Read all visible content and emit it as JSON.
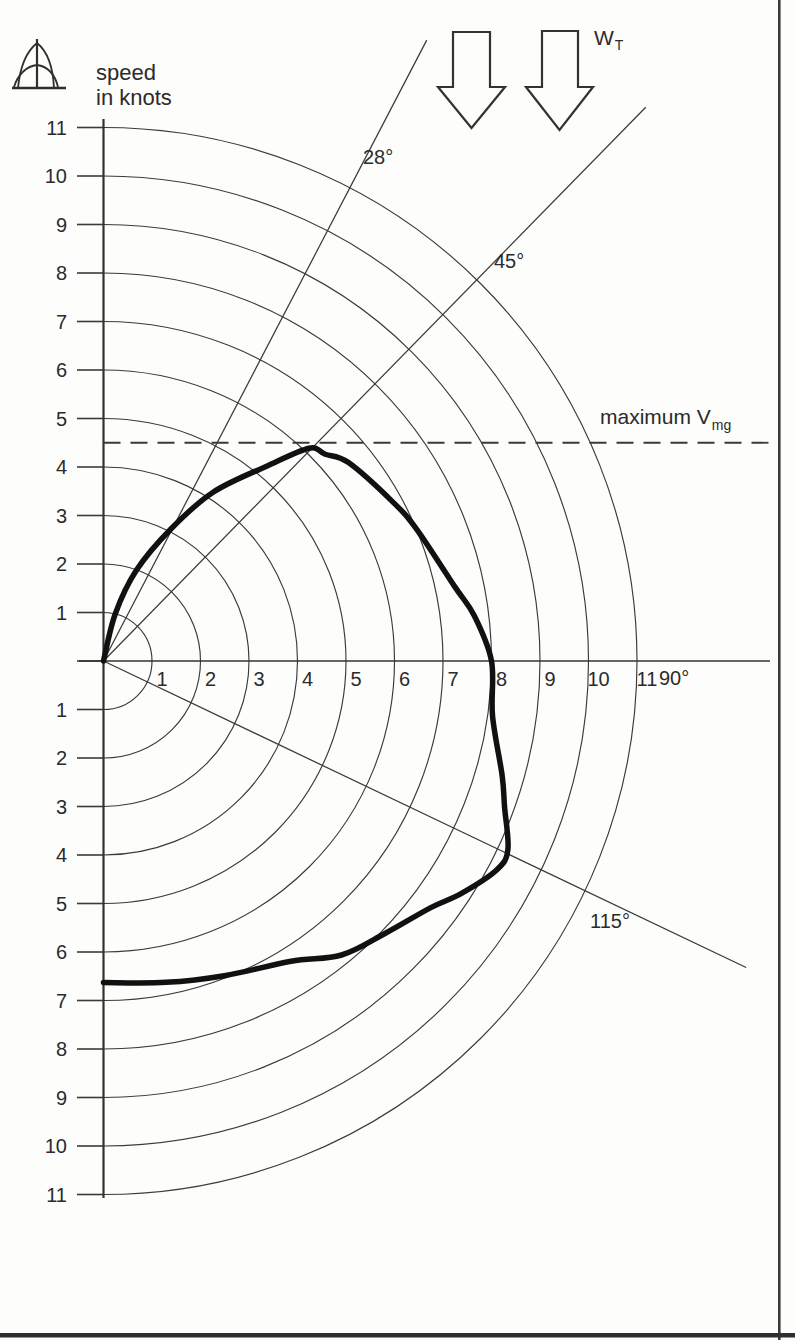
{
  "page": {
    "background": "#fdfdfb",
    "scan_edge_color": "#343434",
    "ink_color": "#3a3a3a",
    "curve_color": "#111111"
  },
  "header": {
    "axis_title_line1": "speed",
    "axis_title_line2": "in knots",
    "true_wind_symbol": "W",
    "true_wind_subscript": "T"
  },
  "labels": {
    "angle_28": "28°",
    "angle_45": "45°",
    "angle_90": "90°",
    "angle_115": "115°",
    "max_vmg_text": "maximum V",
    "max_vmg_subscript": "mg"
  },
  "icons": {
    "boat_icon": "sailboat-bow-view-icon",
    "wind_arrows": "true-wind-direction-arrows"
  },
  "chart_data": {
    "type": "line",
    "subtype": "sailing-polar-diagram",
    "title": "",
    "radial_axis_label": "speed in knots",
    "radial_units": "knots",
    "radial_range": [
      0,
      11
    ],
    "grid": "concentric-semicircles-every-1-knot",
    "radial_ticks_up": [
      "11",
      "10",
      "9",
      "8",
      "7",
      "6",
      "5",
      "4",
      "3",
      "2",
      "1"
    ],
    "radial_ticks_down": [
      "1",
      "2",
      "3",
      "4",
      "5",
      "6",
      "7",
      "8",
      "9",
      "10",
      "11"
    ],
    "radial_ticks_along_90": [
      "1",
      "2",
      "3",
      "4",
      "5",
      "6",
      "7",
      "8",
      "9",
      "10",
      "11"
    ],
    "angle_axis_label_90": "90°",
    "angle_guides_deg": [
      28,
      45,
      115
    ],
    "true_wind_symbol": "WT",
    "true_wind_direction_deg": 0,
    "max_vmg_knots": 4.5,
    "max_vmg_label": "maximum Vmg",
    "series": [
      {
        "name": "boat-speed-polar-curve",
        "points_deg_knots": [
          [
            0,
            0
          ],
          [
            14,
            1.0
          ],
          [
            20,
            2.0
          ],
          [
            27,
            3.05
          ],
          [
            33,
            4.15
          ],
          [
            40,
            5.25
          ],
          [
            44,
            6.1
          ],
          [
            47,
            6.25
          ],
          [
            51,
            6.5
          ],
          [
            61,
            6.8
          ],
          [
            67,
            7.0
          ],
          [
            78,
            7.4
          ],
          [
            83,
            7.7
          ],
          [
            90,
            8.0
          ],
          [
            98,
            8.1
          ],
          [
            106,
            8.55
          ],
          [
            110,
            8.8
          ],
          [
            115,
            9.2
          ],
          [
            118,
            9.18
          ],
          [
            123,
            8.8
          ],
          [
            127,
            8.45
          ],
          [
            134,
            8.08
          ],
          [
            141,
            7.8
          ],
          [
            148,
            7.3
          ],
          [
            159,
            6.95
          ],
          [
            169,
            6.75
          ],
          [
            180,
            6.63
          ]
        ]
      }
    ]
  }
}
